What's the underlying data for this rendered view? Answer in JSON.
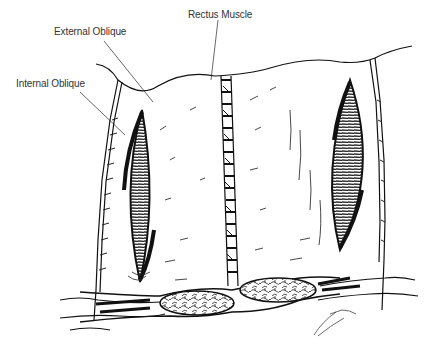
{
  "figure": {
    "type": "anatomical line illustration",
    "labels": {
      "rectus_muscle": "Rectus Muscle",
      "external_oblique": "External Oblique",
      "internal_oblique": "Internal Oblique"
    },
    "colors": {
      "background": "#ffffff",
      "ink": "#111111",
      "label_text": "#333333",
      "leader_line": "#444444"
    }
  }
}
